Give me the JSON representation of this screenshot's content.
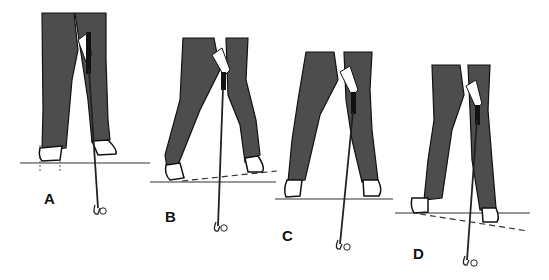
{
  "figures": [
    {
      "id": "A",
      "label": "A",
      "ground": "level",
      "feet": "aligned with vertical guide lines"
    },
    {
      "id": "B",
      "label": "B",
      "ground": "level with dashed line sloping up to right"
    },
    {
      "id": "C",
      "label": "C",
      "ground": "level"
    },
    {
      "id": "D",
      "label": "D",
      "ground": "level with dashed line sloping down to right"
    }
  ],
  "colors": {
    "pants": "#4a4a4a",
    "outline": "#111111",
    "background": "#ffffff"
  }
}
